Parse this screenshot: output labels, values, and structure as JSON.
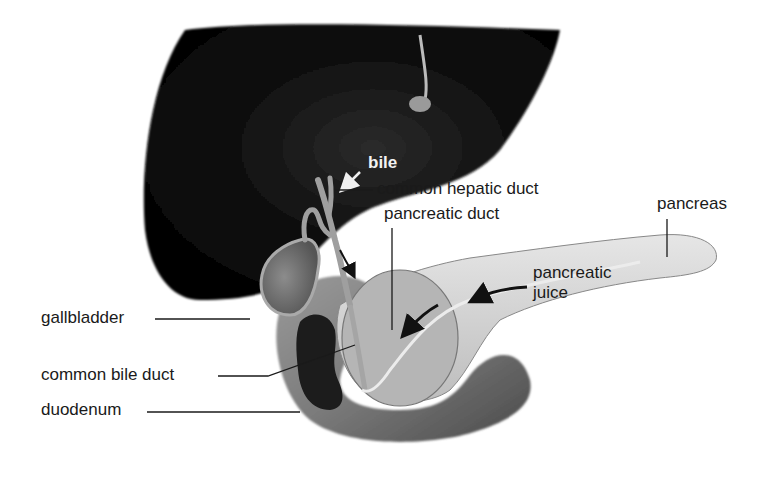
{
  "figure": {
    "colors": {
      "background": "#ffffff",
      "liver": "#0d0d0d",
      "organ_gray": "#8a8a8a",
      "pancreas": "#d9d9d9",
      "label_text": "#1a1a1a",
      "leader_line": "#1a1a1a"
    }
  },
  "labels": {
    "bile": "bile",
    "common_hepatic_duct": "common hepatic duct",
    "pancreatic_duct": "pancreatic duct",
    "pancreas": "pancreas",
    "pancreatic_juice_line1": "pancreatic",
    "pancreatic_juice_line2": "juice",
    "gallbladder": "gallbladder",
    "common_bile_duct": "common bile duct",
    "duodenum": "duodenum"
  }
}
